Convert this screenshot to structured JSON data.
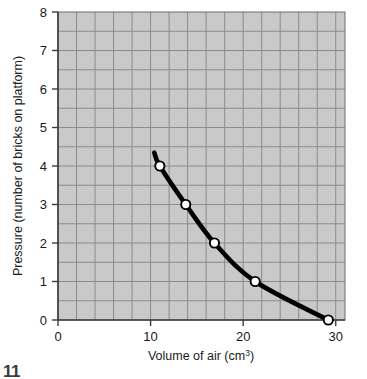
{
  "chart_data": {
    "type": "line",
    "title": "",
    "xlabel": "Volume of air (cm³)",
    "xlabel_main": "Volume of air (cm",
    "xlabel_sup": "3",
    "xlabel_tail": ")",
    "ylabel": "Pressure (number of bricks on platform)",
    "xlim": [
      0,
      31
    ],
    "ylim": [
      0,
      8
    ],
    "xticks": [
      0,
      10,
      20,
      30
    ],
    "xtick_labels": [
      "0",
      "10",
      "20",
      "30"
    ],
    "yticks": [
      0,
      1,
      2,
      3,
      4,
      5,
      6,
      7,
      8
    ],
    "ytick_labels": [
      "0",
      "1",
      "2",
      "3",
      "4",
      "5",
      "6",
      "7",
      "8"
    ],
    "grid": true,
    "grid_major_step_x": 2,
    "grid_major_step_y": 0.5,
    "legend": "none",
    "series": [
      {
        "name": "Pressure vs volume",
        "marker": "open-circle",
        "x": [
          11.0,
          13.8,
          16.9,
          21.3,
          29.2
        ],
        "y": [
          4,
          3,
          2,
          1,
          0
        ]
      }
    ],
    "curve_extension_start": {
      "x": 10.4,
      "y": 4.35
    },
    "colors": {
      "plot_background": "#c9c9c9",
      "gridline": "#8b8b8b",
      "axis": "#3d3d3d",
      "curve": "#000000",
      "marker_fill": "#ffffff",
      "marker_stroke": "#000000",
      "text": "#1a1a1a"
    }
  },
  "footer": {
    "corner_mark": "11"
  }
}
